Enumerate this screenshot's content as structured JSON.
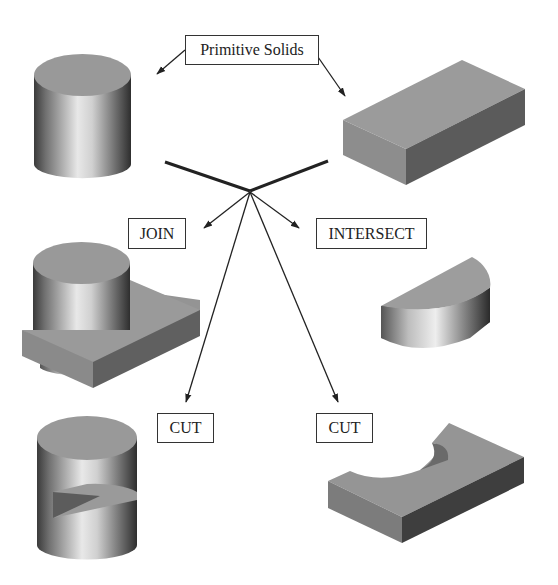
{
  "title_label": "Primitive Solids",
  "operations": {
    "join": "JOIN",
    "intersect": "INTERSECT",
    "cut_left": "CUT",
    "cut_right": "CUT"
  },
  "solids": [
    {
      "id": "primitive-cylinder",
      "kind": "cylinder",
      "role": "primitive"
    },
    {
      "id": "primitive-box",
      "kind": "rectangular block",
      "role": "primitive"
    },
    {
      "id": "join-result",
      "kind": "cylinder joined with block",
      "role": "JOIN result"
    },
    {
      "id": "intersect-result",
      "kind": "half-cylinder segment",
      "role": "INTERSECT result"
    },
    {
      "id": "cut-cylinder-result",
      "kind": "cylinder with block cut out",
      "role": "CUT result"
    },
    {
      "id": "cut-block-result",
      "kind": "block with cylindrical cutout",
      "role": "CUT result"
    }
  ],
  "colors": {
    "top_face": "#9a9a9a",
    "front_face": "#8c8c8c",
    "side_face": "#555555",
    "line": "#222222",
    "background": "#ffffff"
  }
}
